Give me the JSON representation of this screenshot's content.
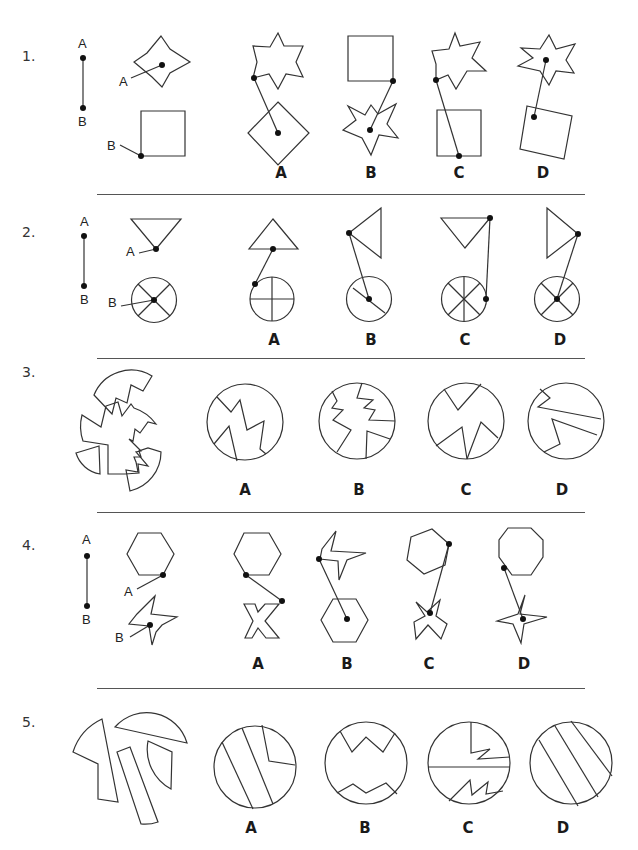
{
  "document": {
    "type": "spatial reasoning test",
    "stroke_color": "#333333",
    "dot_color": "#111111"
  },
  "questions": [
    {
      "number": "1.",
      "key": {
        "top_label": "A",
        "bottom_label": "B"
      },
      "given": {
        "shape_a": "six-pointed star",
        "shape_b": "square",
        "label_a": "A",
        "label_b": "B"
      },
      "options": [
        {
          "label": "A",
          "description": "star on top, rotated square below; line from star left point to square center"
        },
        {
          "label": "B",
          "description": "square on top, star below; line from square corner to star center"
        },
        {
          "label": "C",
          "description": "star on top, square below; line from star left point to square bottom edge"
        },
        {
          "label": "D",
          "description": "star on top, tilted square below; line from star center to square inner point"
        }
      ]
    },
    {
      "number": "2.",
      "key": {
        "top_label": "A",
        "bottom_label": "B"
      },
      "given": {
        "shape_a": "inverted triangle",
        "shape_b": "circle with X",
        "label_a": "A",
        "label_b": "B"
      },
      "options": [
        {
          "label": "A",
          "description": "upright triangle, circle with plus; line from triangle base midpoint to circle edge"
        },
        {
          "label": "B",
          "description": "left-pointing triangle, circle with diagonal; line from triangle tip to circle center"
        },
        {
          "label": "C",
          "description": "inverted triangle, circle with 8 spokes; line from triangle corner to circle edge"
        },
        {
          "label": "D",
          "description": "right-pointing triangle, circle with X; line from triangle tip to circle center"
        }
      ]
    },
    {
      "number": "3.",
      "given": {
        "description": "circle fragments with zigzag cuts"
      },
      "options": [
        {
          "label": "A"
        },
        {
          "label": "B"
        },
        {
          "label": "C"
        },
        {
          "label": "D"
        }
      ]
    },
    {
      "number": "4.",
      "key": {
        "top_label": "A",
        "bottom_label": "B"
      },
      "given": {
        "shape_a": "hexagon",
        "shape_b": "four-pointed pinwheel",
        "label_a": "A",
        "label_b": "B"
      },
      "options": [
        {
          "label": "A"
        },
        {
          "label": "B"
        },
        {
          "label": "C"
        },
        {
          "label": "D"
        }
      ]
    },
    {
      "number": "5.",
      "given": {
        "description": "circle fragments with straight cuts"
      },
      "options": [
        {
          "label": "A"
        },
        {
          "label": "B"
        },
        {
          "label": "C"
        },
        {
          "label": "D"
        }
      ]
    }
  ]
}
